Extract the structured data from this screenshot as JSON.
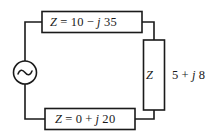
{
  "diagram": {
    "type": "electrical-circuit-schematic",
    "stroke_color": "#1a1a1a",
    "background_color": "#ffffff",
    "source": {
      "name": "ac-voltage-source",
      "symbol": "sine-wave-in-circle"
    },
    "components": [
      {
        "id": "top-impedance",
        "position": "top",
        "symbol": "Z",
        "equals": "=",
        "real": "10",
        "sign": "−",
        "imag_unit": "j",
        "imag": "35",
        "full_label": "Z = 10 − j 35"
      },
      {
        "id": "right-impedance",
        "position": "right",
        "symbol": "Z",
        "real": "5",
        "sign": "+",
        "imag_unit": "j",
        "imag": "8",
        "value_label": "5 + j 8",
        "full_label": "Z  5 + j 8"
      },
      {
        "id": "bottom-impedance",
        "position": "bottom",
        "symbol": "Z",
        "equals": "=",
        "real": "0",
        "sign": "+",
        "imag_unit": "j",
        "imag": "20",
        "full_label": "Z = 0 + j 20"
      }
    ]
  },
  "labels": {
    "top": {
      "z": "Z",
      "eq": "=",
      "real": "10",
      "sign": "−",
      "j": "j",
      "imag": "35"
    },
    "bottom": {
      "z": "Z",
      "eq": "=",
      "real": "0",
      "sign": "+",
      "j": "j",
      "imag": "20"
    },
    "right": {
      "z": "Z",
      "real": "5",
      "sign": "+",
      "j": "j",
      "imag": "8"
    }
  }
}
